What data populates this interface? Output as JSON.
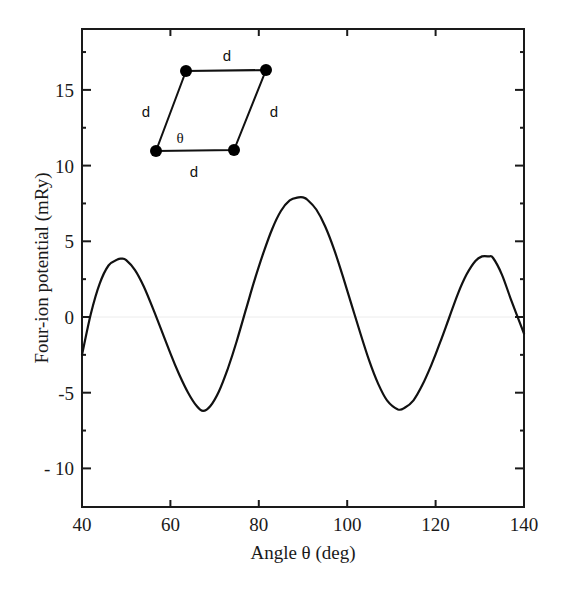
{
  "chart_data": {
    "type": "line",
    "title": "",
    "xlabel": "Angle  θ  (deg)",
    "ylabel": "Four-ion potential (mRy)",
    "xlim": [
      40,
      140
    ],
    "ylim": [
      -12.5,
      19
    ],
    "x_ticks": [
      40,
      60,
      80,
      100,
      120,
      140
    ],
    "x_tick_labels": [
      "40",
      "60",
      "80",
      "100",
      "120",
      "140"
    ],
    "y_ticks": [
      -10,
      -5,
      0,
      5,
      10,
      15
    ],
    "y_tick_labels": [
      "- 10",
      "-5",
      "0",
      "5",
      "10",
      "15"
    ],
    "y_minor_ticks": [
      -7.5,
      -2.5,
      2.5,
      7.5,
      12.5,
      17.5
    ],
    "grid": false,
    "legend": null,
    "series": [
      {
        "name": "Four-ion potential",
        "x": [
          40,
          42,
          44,
          46,
          48,
          49,
          50,
          52,
          54,
          56,
          58,
          60,
          62,
          64,
          66,
          67.4,
          69,
          71,
          73,
          75,
          77,
          79,
          81,
          83,
          85,
          87,
          89,
          90,
          91,
          93,
          95,
          97,
          99,
          101,
          103,
          105,
          107,
          109,
          111.5,
          113,
          115,
          117,
          119,
          121,
          123,
          125,
          127,
          129,
          130.5,
          132,
          133,
          135,
          137,
          140
        ],
        "values": [
          -2.5,
          0.2,
          2.2,
          3.4,
          3.8,
          3.85,
          3.75,
          3.1,
          2.0,
          0.6,
          -0.9,
          -2.4,
          -3.8,
          -5.0,
          -5.9,
          -6.2,
          -5.9,
          -4.9,
          -3.4,
          -1.6,
          0.4,
          2.4,
          4.2,
          5.8,
          7.0,
          7.7,
          7.9,
          7.9,
          7.75,
          7.1,
          6.0,
          4.5,
          2.7,
          0.8,
          -1.1,
          -2.9,
          -4.4,
          -5.5,
          -6.1,
          -6.0,
          -5.5,
          -4.5,
          -3.2,
          -1.7,
          -0.1,
          1.5,
          2.8,
          3.7,
          4.0,
          4.0,
          3.9,
          2.8,
          1.2,
          -1.1
        ]
      }
    ],
    "inset": {
      "description": "Rhombus of four ions with equal sides d and interior angle θ",
      "side_labels": [
        "d",
        "d",
        "d",
        "d"
      ],
      "angle_label": "θ",
      "vertices": 4
    }
  },
  "labels": {
    "inset_top": "d",
    "inset_left": "d",
    "inset_right": "d",
    "inset_bottom": "d",
    "inset_theta": "θ"
  },
  "colors": {
    "axis": "#1a1a1a",
    "curve": "#111111",
    "zero_line": "#e8e8e8"
  }
}
